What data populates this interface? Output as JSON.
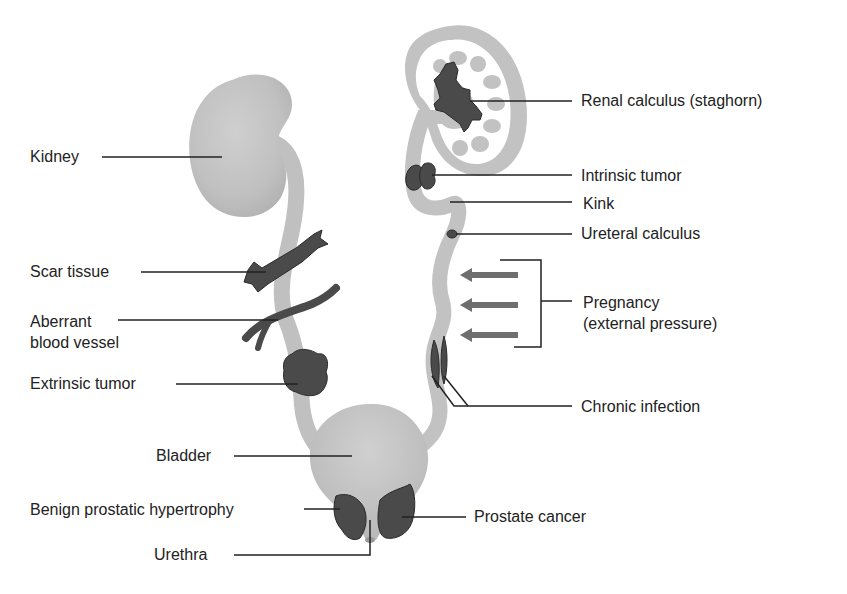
{
  "diagram": {
    "topic": "Causes of urinary tract obstruction",
    "colors": {
      "organ_fill": "#c2c2c2",
      "organ_shade": "#b0b0b0",
      "lesion_fill": "#4a4a4a",
      "arrow_fill": "#6e6e6e",
      "leader_line": "#222222",
      "text": "#222222"
    },
    "labels": {
      "kidney": "Kidney",
      "scar_tissue": "Scar tissue",
      "aberrant_vessel_line1": "Aberrant",
      "aberrant_vessel_line2": "blood vessel",
      "extrinsic_tumor": "Extrinsic tumor",
      "bladder": "Bladder",
      "bph": "Benign prostatic hypertrophy",
      "urethra": "Urethra",
      "renal_calculus": "Renal calculus (staghorn)",
      "intrinsic_tumor": "Intrinsic tumor",
      "kink": "Kink",
      "ureteral_calculus": "Ureteral calculus",
      "pregnancy_line1": "Pregnancy",
      "pregnancy_line2": "(external pressure)",
      "chronic_infection": "Chronic infection",
      "prostate_cancer": "Prostate cancer"
    },
    "pressure_arrows": 3
  }
}
